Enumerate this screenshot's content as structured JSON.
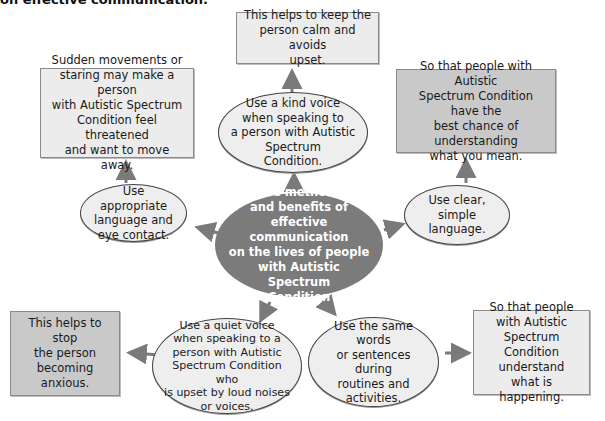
{
  "title": "on effective communication.",
  "center": {
    "text": "The methods\nand benefits of\neffective communication\non the lives of people\nwith Autistic Spectrum\nCondition"
  },
  "methods": [
    {
      "id": "kind-voice",
      "text": "Use a kind voice\nwhen speaking to\na person with Autistic\nSpectrum\nCondition."
    },
    {
      "id": "appropriate-language",
      "text": "Use appropriate\nlanguage and\neye contact."
    },
    {
      "id": "clear-language",
      "text": "Use clear, simple\nlanguage."
    },
    {
      "id": "quiet-voice",
      "text": "Use a quiet voice\nwhen speaking to a\nperson with Autistic\nSpectrum Condition who\nis upset by loud noises\nor voices."
    },
    {
      "id": "same-words",
      "text": "Use the same words\nor sentences during\nroutines and\nactivities."
    }
  ],
  "benefits": [
    {
      "id": "calm",
      "text": "This helps to keep the\nperson calm and avoids\nupset."
    },
    {
      "id": "sudden-movements",
      "text": "Sudden movements or\nstaring may make a person\nwith Autistic Spectrum\nCondition feel threatened\nand want to move away."
    },
    {
      "id": "best-chance",
      "text": "So that people with Autistic\nSpectrum Condition have the\nbest chance of understanding\nwhat you mean."
    },
    {
      "id": "stop-anxious",
      "text": "This helps to stop\nthe person\nbecoming anxious."
    },
    {
      "id": "understand",
      "text": "So that people\nwith Autistic\nSpectrum Condition\nunderstand\nwhat is happening."
    }
  ],
  "colors": {
    "center_fill": "#7b7b7b",
    "box_light": "#ececec",
    "box_dark": "#c9c9c9",
    "arrow": "#7a7a7a"
  }
}
